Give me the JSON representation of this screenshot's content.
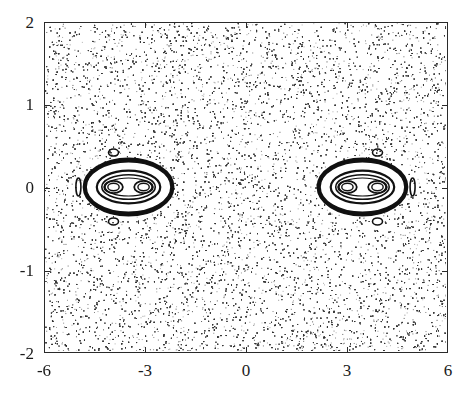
{
  "chart_data": {
    "type": "scatter",
    "title": "",
    "xlabel": "",
    "ylabel": "",
    "xlim": [
      -6,
      6
    ],
    "ylim": [
      -2,
      2
    ],
    "xticks": [
      -6,
      -3,
      0,
      3,
      6
    ],
    "xtick_labels": [
      "-6",
      "-3",
      "0",
      "3",
      "6"
    ],
    "yticks": [
      -2,
      -1,
      0,
      1,
      2
    ],
    "ytick_labels": [
      "-2",
      "-1",
      "0",
      "1",
      "2"
    ],
    "grid": false,
    "legend": null,
    "series": [
      {
        "name": "chaotic-sea",
        "kind": "uniform-scatter",
        "x_range": [
          -6,
          6
        ],
        "y_range": [
          -2,
          2
        ],
        "point_count_approx": 30000,
        "color": "#333333"
      },
      {
        "name": "left-island",
        "kind": "regular-island",
        "center": [
          -3.5,
          0
        ],
        "half_width": 1.3,
        "half_height": 0.28,
        "inner_centers": [
          [
            -3.95,
            0
          ],
          [
            -3.05,
            0
          ]
        ],
        "satellites": [
          [
            -3.95,
            0.42
          ],
          [
            -3.95,
            -0.42
          ],
          [
            -5.0,
            0.0
          ]
        ]
      },
      {
        "name": "right-island",
        "kind": "regular-island",
        "center": [
          3.5,
          0
        ],
        "half_width": 1.3,
        "half_height": 0.28,
        "inner_centers": [
          [
            3.05,
            0
          ],
          [
            3.95,
            0
          ]
        ],
        "satellites": [
          [
            3.95,
            0.42
          ],
          [
            3.95,
            -0.42
          ],
          [
            5.0,
            0.0
          ]
        ]
      }
    ]
  },
  "axes": {
    "x": {
      "labels": [
        "-6",
        "-3",
        "0",
        "3",
        "6"
      ]
    },
    "y": {
      "labels": [
        "2",
        "1",
        "0",
        "-1",
        "-2"
      ]
    }
  }
}
